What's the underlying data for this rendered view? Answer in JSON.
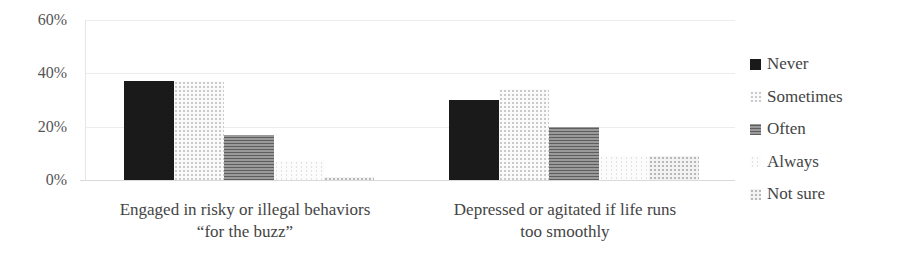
{
  "chart_data": {
    "type": "bar",
    "title": "",
    "xlabel": "",
    "ylabel": "",
    "ylim": [
      0,
      60
    ],
    "yticks": [
      "0%",
      "20%",
      "40%",
      "60%"
    ],
    "grid": true,
    "legend_position": "right",
    "categories": [
      "Engaged in risky or illegal behaviors “for the buzz”",
      "Depressed or agitated if life runs too smoothly"
    ],
    "series": [
      {
        "name": "Never",
        "values": [
          37,
          30
        ]
      },
      {
        "name": "Sometimes",
        "values": [
          37,
          34
        ]
      },
      {
        "name": "Often",
        "values": [
          17,
          20
        ]
      },
      {
        "name": "Always",
        "values": [
          7,
          9
        ]
      },
      {
        "name": "Not sure",
        "values": [
          1,
          9
        ]
      }
    ]
  },
  "axis": {
    "y_ticks": [
      "60%",
      "40%",
      "20%",
      "0%"
    ]
  },
  "categories": [
    {
      "line1": "Engaged in risky or illegal behaviors",
      "line2": "“for the buzz”"
    },
    {
      "line1": "Depressed or agitated if life runs",
      "line2": "too smoothly"
    }
  ],
  "legend": [
    {
      "label": "Never",
      "pattern": "p-never"
    },
    {
      "label": "Sometimes",
      "pattern": "p-sometimes"
    },
    {
      "label": "Often",
      "pattern": "p-often"
    },
    {
      "label": "Always",
      "pattern": "p-always"
    },
    {
      "label": "Not sure",
      "pattern": "p-notsure"
    }
  ]
}
